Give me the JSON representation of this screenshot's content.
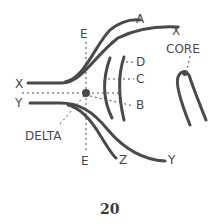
{
  "diagram": {
    "colors": {
      "line": "#4a4a4a",
      "background": "#ffffff"
    },
    "labels": {
      "e_top": "E",
      "a": "A",
      "x_top_right": "X",
      "core": "CORE",
      "d": "D",
      "c": "C",
      "b": "B",
      "x_left": "X",
      "y_left": "Y",
      "delta": "DELTA",
      "e_bottom": "E",
      "z": "Z",
      "y_bottom_right": "Y"
    },
    "figure_number": "20"
  }
}
